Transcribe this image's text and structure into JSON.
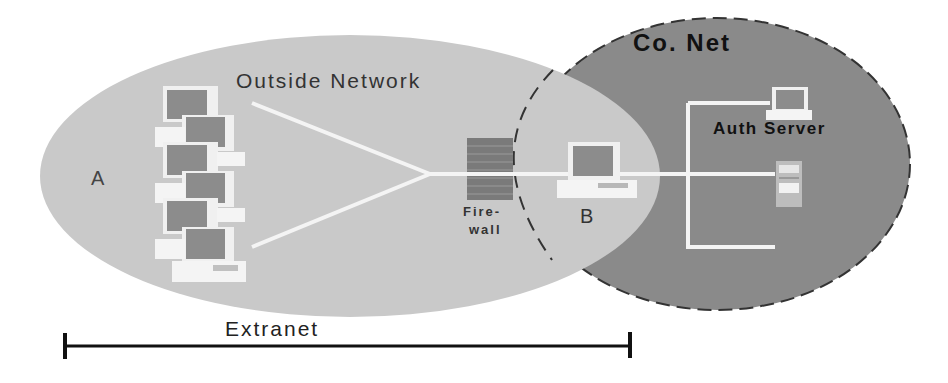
{
  "diagram": {
    "regions": {
      "outside_network": {
        "label": "Outside Network",
        "fill": "#c8c8c8"
      },
      "company_network": {
        "label": "Co. Net",
        "fill": "#8a8a8a",
        "border": "dashed"
      }
    },
    "nodes": {
      "a": {
        "label": "A"
      },
      "b": {
        "label": "B"
      },
      "firewall": {
        "label_line1": "Fire-",
        "label_line2": "wall"
      },
      "auth_server": {
        "label": "Auth Server"
      }
    },
    "span": {
      "label": "Extranet"
    },
    "client_group_count": 6,
    "colors": {
      "link": "#f4f4f4",
      "monitor_screen": "#8c8c8c",
      "device_body": "#f2f2f2",
      "firewall_brick": "#7a7a7a",
      "span_line": "#111111"
    }
  }
}
